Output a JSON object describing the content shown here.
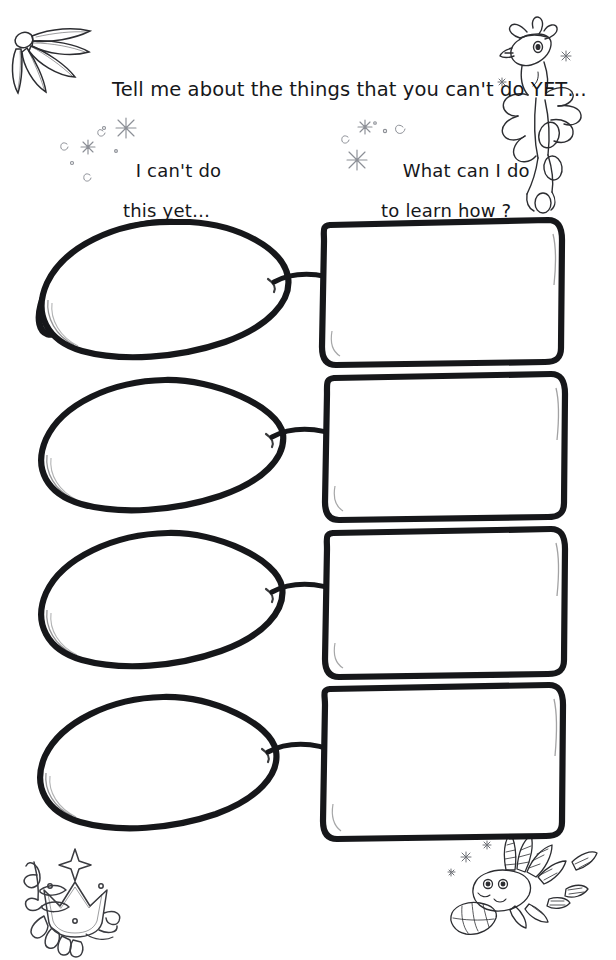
{
  "worksheet": {
    "title": "Tell me about the things that you can't do YET…",
    "columns": {
      "left": {
        "label_line1": "I can't do",
        "label_line2": "this yet…"
      },
      "right": {
        "label_line1": "What can I do",
        "label_line2": "to learn how ?"
      }
    },
    "ink_color": "#16171a",
    "paper_color": "#ffffff",
    "sparkle_color": "#8c8f96",
    "rows": [
      {
        "id": 1,
        "oval_value": "",
        "box_value": ""
      },
      {
        "id": 2,
        "oval_value": "",
        "box_value": ""
      },
      {
        "id": 3,
        "oval_value": "",
        "box_value": ""
      },
      {
        "id": 4,
        "oval_value": "",
        "box_value": ""
      }
    ],
    "decorations": [
      {
        "name": "leaf-frond-decoration",
        "corner": "top-left"
      },
      {
        "name": "bird-creature-decoration",
        "corner": "top-right"
      },
      {
        "name": "crown-decoration",
        "corner": "bottom-left"
      },
      {
        "name": "lionfish-creature-decoration",
        "corner": "bottom-right"
      }
    ]
  }
}
